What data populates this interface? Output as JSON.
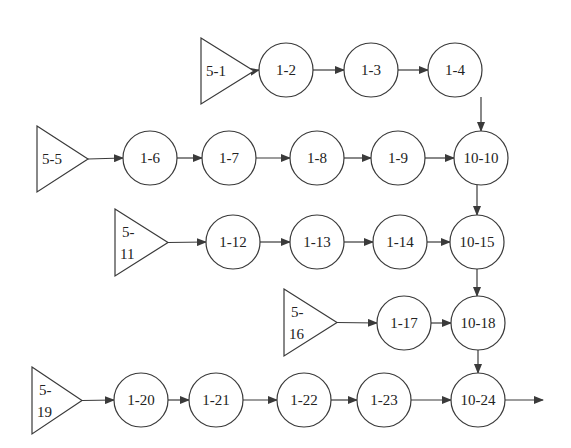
{
  "diagram": {
    "type": "flow",
    "colors": {
      "stroke": "#3a3a3a",
      "fill": "#ffffff",
      "text": "#222222"
    },
    "sources": [
      {
        "id": "5-1",
        "lines": [
          "5-1"
        ],
        "x1": 201,
        "y1": 38,
        "x2": 254,
        "y2": 104
      },
      {
        "id": "5-5",
        "lines": [
          "5-5"
        ],
        "x1": 37,
        "y1": 126,
        "x2": 88,
        "y2": 192
      },
      {
        "id": "5-11",
        "lines": [
          "5-",
          "11"
        ],
        "x1": 115,
        "y1": 209,
        "x2": 168,
        "y2": 276
      },
      {
        "id": "5-16",
        "lines": [
          "5-",
          "16"
        ],
        "x1": 284,
        "y1": 289,
        "x2": 337,
        "y2": 356
      },
      {
        "id": "5-19",
        "lines": [
          "5-",
          "19"
        ],
        "x1": 32,
        "y1": 367,
        "x2": 82,
        "y2": 434
      }
    ],
    "nodes": [
      {
        "id": "1-2",
        "label": "1-2",
        "cx": 286,
        "cy": 70
      },
      {
        "id": "1-3",
        "label": "1-3",
        "cx": 371,
        "cy": 70
      },
      {
        "id": "1-4",
        "label": "1-4",
        "cx": 455,
        "cy": 70
      },
      {
        "id": "1-6",
        "label": "1-6",
        "cx": 150,
        "cy": 158
      },
      {
        "id": "1-7",
        "label": "1-7",
        "cx": 229,
        "cy": 158
      },
      {
        "id": "1-8",
        "label": "1-8",
        "cx": 317,
        "cy": 158
      },
      {
        "id": "1-9",
        "label": "1-9",
        "cx": 398,
        "cy": 158
      },
      {
        "id": "10-10",
        "label": "10-10",
        "cx": 481,
        "cy": 158
      },
      {
        "id": "1-12",
        "label": "1-12",
        "cx": 233,
        "cy": 242
      },
      {
        "id": "1-13",
        "label": "1-13",
        "cx": 317,
        "cy": 242
      },
      {
        "id": "1-14",
        "label": "1-14",
        "cx": 400,
        "cy": 242
      },
      {
        "id": "10-15",
        "label": "10-15",
        "cx": 477,
        "cy": 242
      },
      {
        "id": "1-17",
        "label": "1-17",
        "cx": 404,
        "cy": 323
      },
      {
        "id": "10-18",
        "label": "10-18",
        "cx": 478,
        "cy": 323
      },
      {
        "id": "1-20",
        "label": "1-20",
        "cx": 141,
        "cy": 400
      },
      {
        "id": "1-21",
        "label": "1-21",
        "cx": 216,
        "cy": 400
      },
      {
        "id": "1-22",
        "label": "1-22",
        "cx": 304,
        "cy": 400
      },
      {
        "id": "1-23",
        "label": "1-23",
        "cx": 384,
        "cy": 400
      },
      {
        "id": "10-24",
        "label": "10-24",
        "cx": 478,
        "cy": 400
      }
    ],
    "edges": [
      [
        "5-1",
        "1-2"
      ],
      [
        "1-2",
        "1-3"
      ],
      [
        "1-3",
        "1-4"
      ],
      [
        "1-4",
        "10-10"
      ],
      [
        "5-5",
        "1-6"
      ],
      [
        "1-6",
        "1-7"
      ],
      [
        "1-7",
        "1-8"
      ],
      [
        "1-8",
        "1-9"
      ],
      [
        "1-9",
        "10-10"
      ],
      [
        "10-10",
        "10-15"
      ],
      [
        "5-11",
        "1-12"
      ],
      [
        "1-12",
        "1-13"
      ],
      [
        "1-13",
        "1-14"
      ],
      [
        "1-14",
        "10-15"
      ],
      [
        "10-15",
        "10-18"
      ],
      [
        "5-16",
        "1-17"
      ],
      [
        "1-17",
        "10-18"
      ],
      [
        "10-18",
        "10-24"
      ],
      [
        "5-19",
        "1-20"
      ],
      [
        "1-20",
        "1-21"
      ],
      [
        "1-21",
        "1-22"
      ],
      [
        "1-22",
        "1-23"
      ],
      [
        "1-23",
        "10-24"
      ],
      [
        "10-24",
        "out"
      ]
    ],
    "output_arrow_end": {
      "x": 543,
      "y": 400
    },
    "node_radius": 27
  }
}
